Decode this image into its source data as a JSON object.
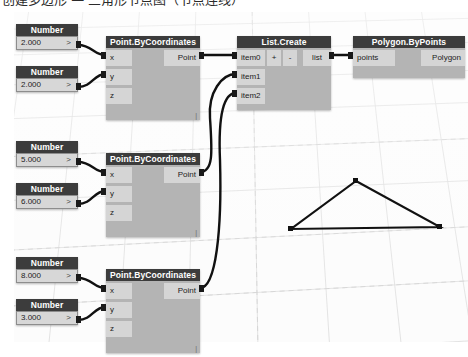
{
  "caption": {
    "text": "创建多边形 — 三角形节点图（节点连线）"
  },
  "canvas": {
    "background_color": "#fbfbfb",
    "grid_color": "#d9d9d9",
    "node_header_color": "#3c3c3c",
    "node_body_color": "#b4b4b4",
    "port_color": "#d5d5d5",
    "wire_color": "#111111"
  },
  "number_nodes": [
    {
      "title": "Number",
      "value": "2.000",
      "chevron": ">"
    },
    {
      "title": "Number",
      "value": "2.000",
      "chevron": ">"
    },
    {
      "title": "Number",
      "value": "5.000",
      "chevron": ">"
    },
    {
      "title": "Number",
      "value": "6.000",
      "chevron": ">"
    },
    {
      "title": "Number",
      "value": "8.000",
      "chevron": ">"
    },
    {
      "title": "Number",
      "value": "3.000",
      "chevron": ">"
    }
  ],
  "point_nodes": [
    {
      "title": "Point.ByCoordinates",
      "in": [
        "x",
        "y",
        "z"
      ],
      "out": "Point",
      "corner": "|"
    },
    {
      "title": "Point.ByCoordinates",
      "in": [
        "x",
        "y",
        "z"
      ],
      "out": "Point",
      "corner": "|"
    },
    {
      "title": "Point.ByCoordinates",
      "in": [
        "x",
        "y",
        "z"
      ],
      "out": "Point",
      "corner": "|"
    }
  ],
  "list_node": {
    "title": "List.Create",
    "in": [
      "item0",
      "item1",
      "item2"
    ],
    "add_button": "+",
    "remove_button": "-",
    "out": "list"
  },
  "polygon_node": {
    "title": "Polygon.ByPoints",
    "in": "points",
    "out": "Polygon"
  },
  "geometry": {
    "type": "triangle",
    "vertices": [
      {
        "x": 356,
        "y": 181
      },
      {
        "x": 291,
        "y": 229
      },
      {
        "x": 440,
        "y": 227
      }
    ],
    "stroke_color": "#111111",
    "vertex_marker": "square"
  }
}
